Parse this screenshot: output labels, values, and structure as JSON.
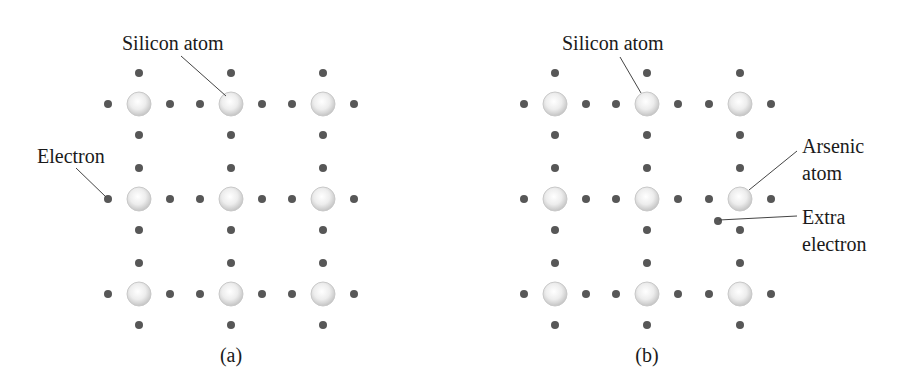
{
  "colors": {
    "background": "#ffffff",
    "electron": "#575757",
    "atom_center": "#ffffff",
    "atom_edge": "#c4c4c4",
    "leader_line": "#444444",
    "text": "#1a1a1a"
  },
  "panels": [
    {
      "id": "a",
      "caption": "(a)",
      "caption_pos": [
        231,
        362
      ],
      "atom_cols": [
        139,
        231,
        323
      ],
      "atom_rows": [
        104,
        199,
        294
      ],
      "electron_offset": 31,
      "labels": [
        {
          "name": "silicon-atom-label",
          "lines": [
            "Silicon atom"
          ],
          "x": 122,
          "y": 50,
          "line_height": 26,
          "leader": [
            181,
            56,
            226,
            96
          ]
        },
        {
          "name": "electron-label",
          "lines": [
            "Electron"
          ],
          "x": 37,
          "y": 163,
          "line_height": 26,
          "leader": [
            76,
            168,
            106,
            197
          ]
        }
      ],
      "special_atoms": [],
      "extra_electrons": []
    },
    {
      "id": "b",
      "caption": "(b)",
      "caption_pos": [
        647,
        362
      ],
      "atom_cols": [
        555,
        647,
        740
      ],
      "atom_rows": [
        104,
        199,
        294
      ],
      "electron_offset": 31,
      "labels": [
        {
          "name": "silicon-atom-label",
          "lines": [
            "Silicon atom"
          ],
          "x": 562,
          "y": 50,
          "line_height": 26,
          "leader": [
            620,
            57,
            641,
            93
          ]
        },
        {
          "name": "arsenic-atom-label",
          "lines": [
            "Arsenic",
            "atom"
          ],
          "x": 802,
          "y": 153,
          "line_height": 27,
          "leader": [
            797,
            151,
            749,
            190
          ]
        },
        {
          "name": "extra-electron-label",
          "lines": [
            "Extra",
            "electron"
          ],
          "x": 802,
          "y": 224,
          "line_height": 27,
          "leader": [
            719,
            220,
            797,
            216
          ]
        }
      ],
      "special_atoms": [
        {
          "name": "arsenic-atom",
          "col": 2,
          "row": 1
        }
      ],
      "extra_electrons": [
        {
          "x": 718,
          "y": 221
        }
      ]
    }
  ]
}
